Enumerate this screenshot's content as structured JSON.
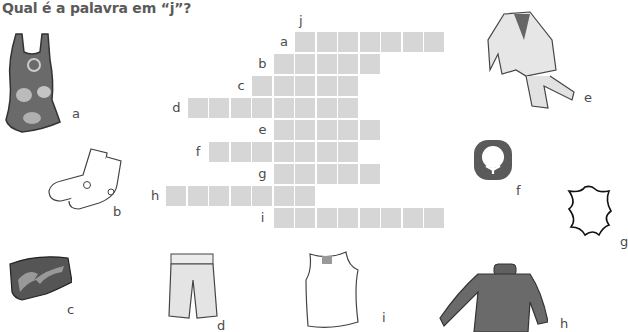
{
  "title": "Qual é a palavra em “j”?",
  "crossword": {
    "column_label": "j",
    "cell_color": "#d6d6d6",
    "rows": [
      {
        "label": "a",
        "start_col": 6,
        "length": 7
      },
      {
        "label": "b",
        "start_col": 5,
        "length": 5
      },
      {
        "label": "c",
        "start_col": 4,
        "length": 5
      },
      {
        "label": "d",
        "start_col": 1,
        "length": 8
      },
      {
        "label": "e",
        "start_col": 5,
        "length": 5
      },
      {
        "label": "f",
        "start_col": 2,
        "length": 7
      },
      {
        "label": "g",
        "start_col": 5,
        "length": 5
      },
      {
        "label": "h",
        "start_col": 0,
        "length": 7
      },
      {
        "label": "i",
        "start_col": 5,
        "length": 8
      }
    ]
  },
  "pictures": [
    {
      "label": "a",
      "icon": "swimsuit-icon"
    },
    {
      "label": "b",
      "icon": "socks-icon"
    },
    {
      "label": "c",
      "icon": "swim-trunks-icon"
    },
    {
      "label": "d",
      "icon": "shorts-icon"
    },
    {
      "label": "e",
      "icon": "suit-icon"
    },
    {
      "label": "f",
      "icon": "cotton-logo-icon"
    },
    {
      "label": "g",
      "icon": "leather-symbol-icon"
    },
    {
      "label": "h",
      "icon": "sweater-icon"
    },
    {
      "label": "i",
      "icon": "tank-top-icon"
    }
  ]
}
